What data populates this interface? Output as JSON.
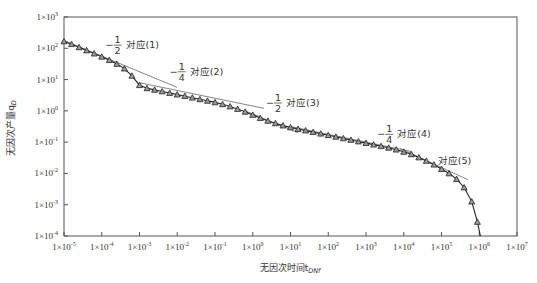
{
  "chart_data": {
    "type": "line",
    "title": "",
    "xlabel": "无因次时间t_DNf",
    "ylabel": "无因次产量q_D",
    "xscale": "log",
    "yscale": "log",
    "xlim": [
      1e-05,
      10000000.0
    ],
    "ylim": [
      0.0001,
      1000.0
    ],
    "grid": false,
    "x_tick_labels": [
      "1×10^-5",
      "1×10^-4",
      "1×10^-3",
      "1×10^-2",
      "1×10^-1",
      "1×10^0",
      "1×10^1",
      "1×10^2",
      "1×10^3",
      "1×10^4",
      "1×10^5",
      "1×10^6",
      "1×10^7"
    ],
    "y_tick_labels": [
      "1×10^3",
      "1×10^2",
      "1×10^1",
      "1×10^0",
      "1×10^-1",
      "1×10^-2",
      "1×10^-3",
      "1×10^-4"
    ],
    "series": [
      {
        "name": "典型曲线 (markers ▲ with fitted solid line)",
        "marker": "triangle",
        "log10_x": [
          -5.0,
          -4.8,
          -4.6,
          -4.4,
          -4.2,
          -4.0,
          -3.8,
          -3.6,
          -3.4,
          -3.2,
          -3.0,
          -2.8,
          -2.6,
          -2.4,
          -2.2,
          -2.0,
          -1.8,
          -1.6,
          -1.4,
          -1.2,
          -1.0,
          -0.8,
          -0.6,
          -0.4,
          -0.2,
          0.0,
          0.2,
          0.4,
          0.6,
          0.8,
          1.0,
          1.2,
          1.4,
          1.6,
          1.8,
          2.0,
          2.2,
          2.4,
          2.6,
          2.8,
          3.0,
          3.2,
          3.4,
          3.6,
          3.8,
          4.0,
          4.2,
          4.4,
          4.6,
          4.8,
          5.0,
          5.2,
          5.4,
          5.6,
          5.8,
          5.95
        ],
        "log10_y": [
          2.22,
          2.13,
          2.03,
          1.93,
          1.83,
          1.73,
          1.62,
          1.5,
          1.35,
          1.12,
          0.82,
          0.72,
          0.67,
          0.62,
          0.57,
          0.52,
          0.47,
          0.42,
          0.37,
          0.32,
          0.27,
          0.21,
          0.14,
          0.06,
          -0.03,
          -0.13,
          -0.23,
          -0.32,
          -0.4,
          -0.47,
          -0.53,
          -0.58,
          -0.63,
          -0.68,
          -0.73,
          -0.78,
          -0.83,
          -0.88,
          -0.93,
          -0.98,
          -1.03,
          -1.08,
          -1.13,
          -1.18,
          -1.24,
          -1.31,
          -1.39,
          -1.49,
          -1.6,
          -1.72,
          -1.86,
          -2.0,
          -2.18,
          -2.45,
          -2.9,
          -3.55
        ]
      }
    ],
    "reference_lines": [
      {
        "label": "-1/2 对应(1)",
        "slope": -0.5,
        "log10_x": [
          -5.0,
          -2.0
        ],
        "log10_y": [
          2.25,
          0.75
        ]
      },
      {
        "label": "-1/4 对应(2)",
        "slope": -0.25,
        "log10_x": [
          -3.0,
          0.3
        ],
        "log10_y": [
          0.9,
          0.08
        ]
      },
      {
        "label": "-1/2 对应(3)",
        "slope": -0.5,
        "log10_x": [
          -0.2,
          1.2
        ],
        "log10_y": [
          0.0,
          -0.7
        ]
      },
      {
        "label": "-1/4 对应(4)",
        "slope": -0.25,
        "log10_x": [
          1.0,
          4.2
        ],
        "log10_y": [
          -0.5,
          -1.3
        ]
      },
      {
        "label": "对应(5)",
        "slope": null,
        "log10_x": [
          3.9,
          5.7
        ],
        "log10_y": [
          -1.2,
          -2.2
        ]
      }
    ],
    "annotations": [
      {
        "text_frac": "-1/2",
        "text": "对应(1)",
        "log10_x": -3.9,
        "log10_y": 2.1
      },
      {
        "text_frac": "-1/4",
        "text": "对应(2)",
        "log10_x": -2.2,
        "log10_y": 1.25
      },
      {
        "text_frac": "-1/2",
        "text": "对应(3)",
        "log10_x": 0.35,
        "log10_y": 0.25
      },
      {
        "text_frac": "-1/4",
        "text": "对应(4)",
        "log10_x": 3.3,
        "log10_y": -0.75
      },
      {
        "text_frac": "",
        "text": "对应(5)",
        "log10_x": 4.9,
        "log10_y": -1.6
      }
    ]
  }
}
